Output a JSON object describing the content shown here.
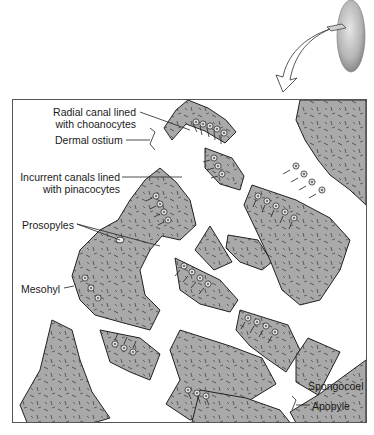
{
  "figure": {
    "type": "labeled biological diagram",
    "inset": "whole sponge with cut section and curved arrow pointing to enlarged view",
    "colors": {
      "tissue_fill": "#a9a9a9",
      "outline": "#2a2a2a",
      "background": "#ffffff",
      "box_border": "#555555"
    }
  },
  "labels": {
    "radial_canal": {
      "line1": "Radial canal lined",
      "line2": "with choanocytes"
    },
    "dermal_ostium": "Dermal ostium",
    "incurrent_canals": {
      "line1": "Incurrent canals lined",
      "line2": "with pinacocytes"
    },
    "prosopyles": "Prosopyles",
    "mesohyl": "Mesohyl",
    "spongocoel": "Spongocoel",
    "apopyle": "Apopyle"
  }
}
